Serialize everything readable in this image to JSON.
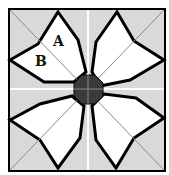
{
  "diagram": {
    "type": "quilt-block",
    "labels": {
      "a": "A",
      "b": "B"
    },
    "colors": {
      "background": "#d9d9d9",
      "petal": "#ffffff",
      "outline": "#000000",
      "center": "#3a3a3a",
      "grid_light": "#ffffff",
      "diagonal": "#8a8a8a"
    }
  }
}
